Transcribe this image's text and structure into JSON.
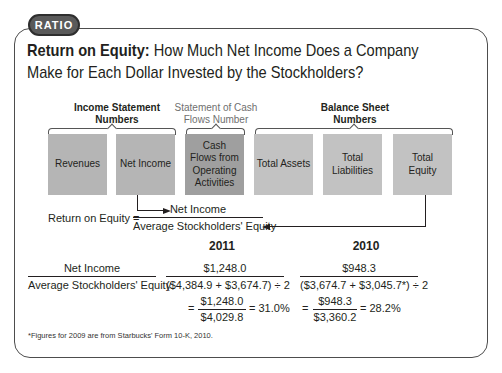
{
  "badge": {
    "label": "RATIO"
  },
  "title": {
    "bold": "Return on Equity:",
    "rest_line1": " How Much Net Income Does a Company",
    "line2": "Make for Each Dollar Invested by the Stockholders?"
  },
  "groups": [
    {
      "line1": "Income Statement",
      "line2": "Numbers"
    },
    {
      "line1": "Statement of Cash",
      "line2": "Flows Number"
    },
    {
      "line1": "Balance Sheet",
      "line2": "Numbers"
    }
  ],
  "boxes": [
    {
      "label": "Revenues"
    },
    {
      "label": "Net Income"
    },
    {
      "label": "Cash Flows from Operating Activities"
    },
    {
      "label": "Total Assets"
    },
    {
      "label": "Total Liabilities"
    },
    {
      "label": "Total Equity"
    }
  ],
  "formula": {
    "lhs": "Return on Equity =",
    "numerator": "Net Income",
    "denominator": "Average Stockholders' Equity"
  },
  "calc": {
    "label_numerator": "Net Income",
    "label_denominator": "Average Stockholders' Equity",
    "years": [
      {
        "year": "2011",
        "numerator": "$1,248.0",
        "denominator": "($4,384.9 + $3,674.7) ÷ 2",
        "eq": "=",
        "result_numerator": "$1,248.0",
        "result_denominator": "$4,029.8",
        "result": "= 31.0%"
      },
      {
        "year": "2010",
        "numerator": "$948.3",
        "denominator": "($3,674.7 + $3,045.7*) ÷ 2",
        "eq": "=",
        "result_numerator": "$948.3",
        "result_denominator": "$3,360.2",
        "result": "= 28.2%"
      }
    ]
  },
  "footnote": "*Figures for 2009 are from Starbucks' Form 10-K, 2010."
}
